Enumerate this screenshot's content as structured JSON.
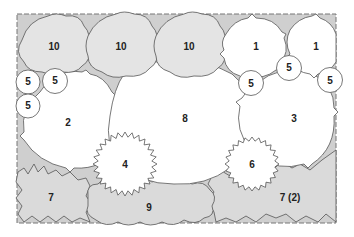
{
  "diagram": {
    "type": "planting-plan",
    "colors": {
      "bed_fill": "#cfcfcf",
      "border_stroke": "#777777",
      "gray_plant": "#e4e4e4",
      "white_plant": "#ffffff",
      "ground_plant": "#dadada",
      "outline": "#555555"
    },
    "plants": [
      {
        "id": "p10a",
        "label": "10",
        "shape": "scalloped",
        "fill": "gray"
      },
      {
        "id": "p10b",
        "label": "10",
        "shape": "scalloped",
        "fill": "gray"
      },
      {
        "id": "p10c",
        "label": "10",
        "shape": "scalloped",
        "fill": "gray"
      },
      {
        "id": "p1a",
        "label": "1",
        "shape": "jagged-round",
        "fill": "white"
      },
      {
        "id": "p1b",
        "label": "1",
        "shape": "jagged-round",
        "fill": "white"
      },
      {
        "id": "p5a",
        "label": "5",
        "shape": "circle",
        "fill": "white"
      },
      {
        "id": "p5b",
        "label": "5",
        "shape": "circle",
        "fill": "white"
      },
      {
        "id": "p5c",
        "label": "5",
        "shape": "circle",
        "fill": "white"
      },
      {
        "id": "p5d",
        "label": "5",
        "shape": "circle",
        "fill": "white"
      },
      {
        "id": "p5e",
        "label": "5",
        "shape": "circle",
        "fill": "white"
      },
      {
        "id": "p5f",
        "label": "5",
        "shape": "circle",
        "fill": "white"
      },
      {
        "id": "p2",
        "label": "2",
        "shape": "round",
        "fill": "white"
      },
      {
        "id": "p8",
        "label": "8",
        "shape": "round",
        "fill": "white"
      },
      {
        "id": "p3",
        "label": "3",
        "shape": "round",
        "fill": "white"
      },
      {
        "id": "p4",
        "label": "4",
        "shape": "spiky",
        "fill": "white"
      },
      {
        "id": "p6",
        "label": "6",
        "shape": "spiky",
        "fill": "white"
      },
      {
        "id": "p7a",
        "label": "7",
        "shape": "jagged",
        "fill": "ground"
      },
      {
        "id": "p9",
        "label": "9",
        "shape": "billowy",
        "fill": "ground"
      },
      {
        "id": "p7b",
        "label": "7 (2)",
        "shape": "jagged",
        "fill": "ground"
      }
    ]
  }
}
